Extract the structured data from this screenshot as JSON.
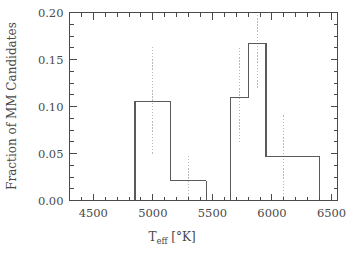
{
  "chart_data": {
    "type": "bar",
    "title": "",
    "subtitle": "",
    "xlabel": "T_eff  [°K]",
    "xlabel_base": "T",
    "xlabel_sub": "eff",
    "xlabel_unit": "[°K]",
    "ylabel": "Fraction of MM Candidates",
    "xlim": [
      4300,
      6550
    ],
    "ylim": [
      0.0,
      0.2
    ],
    "x_major_ticks": [
      4500,
      5000,
      5500,
      6000,
      6500
    ],
    "x_major_tick_labels": [
      "4500",
      "5000",
      "5500",
      "6000",
      "6500"
    ],
    "x_minor_tick_step": 100,
    "y_major_ticks": [
      0.0,
      0.05,
      0.1,
      0.15,
      0.2
    ],
    "y_major_tick_labels": [
      "0.00",
      "0.05",
      "0.10",
      "0.15",
      "0.20"
    ],
    "y_minor_tick_step": 0.0125,
    "grid": false,
    "legend": null,
    "bin_edges": [
      4850,
      5150,
      5450,
      5650,
      5800,
      5950,
      6250,
      6400
    ],
    "bins": [
      {
        "x0": 4850,
        "x1": 5150,
        "value": 0.105,
        "err_low": 0.05,
        "err_high": 0.163,
        "err_x": 5000
      },
      {
        "x0": 5150,
        "x1": 5450,
        "value": 0.021,
        "err_low": 0.0,
        "err_high": 0.048,
        "err_x": 5300
      },
      {
        "x0": 5650,
        "x1": 5800,
        "value": 0.11,
        "err_low": 0.062,
        "err_high": 0.163,
        "err_x": 5725
      },
      {
        "x0": 5800,
        "x1": 5950,
        "value": 0.167,
        "err_low": 0.12,
        "err_high": 0.2,
        "err_x": 5875
      },
      {
        "x0": 5950,
        "x1": 6250,
        "value": 0.047,
        "err_low": 0.0,
        "err_high": 0.092,
        "err_x": 6100
      },
      {
        "x0": 6250,
        "x1": 6400,
        "value": 0.047,
        "err_low": 0.047,
        "err_high": 0.047,
        "err_x": 6325
      }
    ],
    "colors": {
      "axis": "#4a4a4a",
      "histogram": "#5a5a5a",
      "errorbar": "#b9b9b9",
      "background": "#ffffff"
    }
  }
}
